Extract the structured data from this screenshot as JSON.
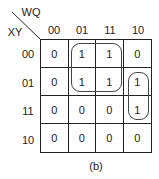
{
  "kmap": {
    "row_var": "XY",
    "col_var": "WQ",
    "col_labels": [
      "00",
      "01",
      "11",
      "10"
    ],
    "row_labels": [
      "00",
      "01",
      "11",
      "10"
    ],
    "cells": [
      [
        "0",
        "1",
        "1",
        "0"
      ],
      [
        "0",
        "1",
        "1",
        "1"
      ],
      [
        "0",
        "0",
        "0",
        "1"
      ],
      [
        "0",
        "0",
        "0",
        "0"
      ]
    ],
    "groups": [
      {
        "name": "group-square",
        "rows": [
          "00",
          "01"
        ],
        "cols": [
          "01",
          "11"
        ]
      },
      {
        "name": "group-pair",
        "rows": [
          "01",
          "11"
        ],
        "cols": [
          "10"
        ]
      }
    ]
  },
  "caption": "(b)"
}
